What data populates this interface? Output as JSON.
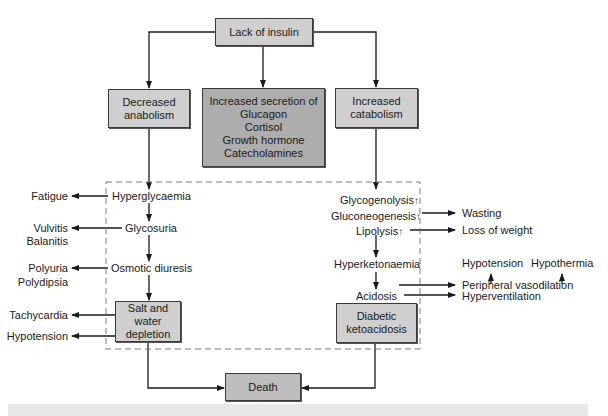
{
  "diagram": {
    "title_box": "Lack of insulin",
    "level2": {
      "left": [
        "Decreased",
        "anabolism"
      ],
      "center": [
        "Increased secretion of",
        "Glucagon",
        "Cortisol",
        "Growth hormone",
        "Catecholamines"
      ],
      "right": [
        "Increased",
        "catabolism"
      ]
    },
    "left_chain": {
      "hyperglycaemia": "Hyperglycaemia",
      "glycosuria": "Glycosuria",
      "osmotic_diuresis": "Osmotic diuresis",
      "salt_water_box": [
        "Salt and",
        "water",
        "depletion"
      ]
    },
    "left_outcomes": {
      "fatigue": "Fatigue",
      "vulvitis": "Vulvitis",
      "balanitis": "Balanitis",
      "polyuria": "Polyuria",
      "polydipsia": "Polydipsia",
      "tachycardia": "Tachycardia",
      "hypotension": "Hypotension"
    },
    "right_chain": {
      "glycogenolysis": "Glycogenolysis",
      "gluconeogenesis": "Gluconeogenesis",
      "lipolysis": "Lipolysis",
      "hyperketonaemia": "Hyperketonaemia",
      "acidosis": "Acidosis",
      "dka_box": [
        "Diabetic",
        "ketoacidosis"
      ],
      "increase_symbol": "↑"
    },
    "right_outcomes": {
      "wasting": "Wasting",
      "loss_of_weight": "Loss of weight",
      "hypotension": "Hypotension",
      "hypothermia": "Hypothermia",
      "peripheral_vasodilation": "Peripheral vasodilation",
      "hyperventilation": "Hyperventilation"
    },
    "final_box": "Death"
  },
  "colors": {
    "light_box": "#cfcfcf",
    "dark_box": "#adadad",
    "line": "#1a1a1a",
    "dashed": "#7a7a7a",
    "footer_band": "#e8e8e8"
  }
}
